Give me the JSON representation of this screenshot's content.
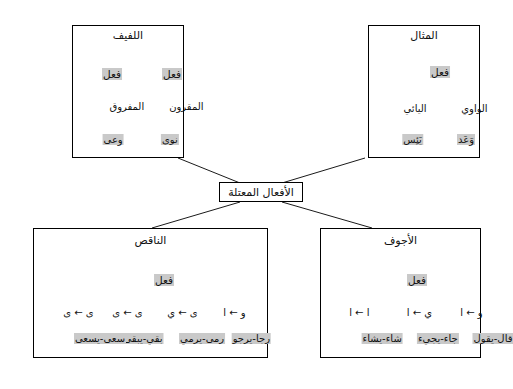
{
  "diagram": {
    "root": {
      "label": "الأفعال المعتلة"
    },
    "boxes": [
      {
        "id": "al-lafif",
        "title": "اللفيف",
        "root_node": "فعل",
        "branches": [
          {
            "node": "فعل",
            "label": "المقرون",
            "example": "نوى"
          },
          {
            "node": "فعل",
            "label": "المفروق",
            "example": "وعى"
          }
        ]
      },
      {
        "id": "al-mithal",
        "title": "المثال",
        "root_node": "فعل",
        "branches": [
          {
            "label": "الواوي",
            "example": "وَعَد"
          },
          {
            "label": "اليائي",
            "example": "يَئِس"
          }
        ]
      },
      {
        "id": "an-naqis",
        "title": "الناقص",
        "root_node": "فعل",
        "branches": [
          {
            "rule": "و ← ا",
            "example": "رجا-يرجو"
          },
          {
            "rule": "ى ← ي",
            "example": "رمى-يرمي"
          },
          {
            "rule": "ى ← ى",
            "example": "بقي-يبقى"
          },
          {
            "rule": "ى ← ى",
            "example": "سعى-يسعى"
          }
        ]
      },
      {
        "id": "al-ajwaf",
        "title": "الأجوف",
        "root_node": "فعل",
        "branches": [
          {
            "rule": "و ← ا",
            "example": "قال-يقول"
          },
          {
            "rule": "ي ← ا",
            "example": "جاء-يجيء"
          },
          {
            "rule": "ا ← ا",
            "example": "شاء-يشاء"
          }
        ]
      }
    ],
    "colors": {
      "highlight": "#c9c9c9",
      "line": "#000000",
      "text": "#111111",
      "background": "#ffffff"
    }
  }
}
